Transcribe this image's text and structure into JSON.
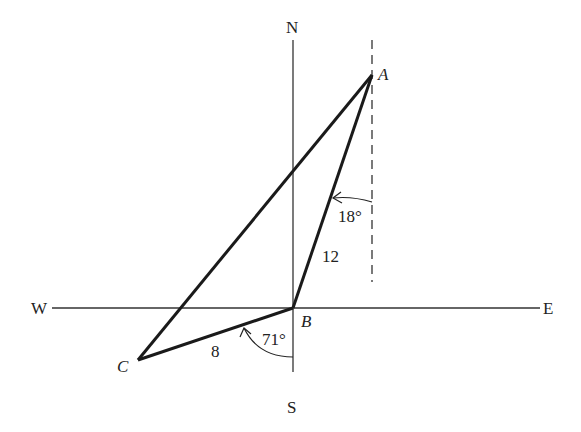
{
  "compass": {
    "north": "N",
    "south": "S",
    "west": "W",
    "east": "E"
  },
  "points": {
    "A": "A",
    "B": "B",
    "C": "C"
  },
  "sides": {
    "AB": "12",
    "BC": "8"
  },
  "angles": {
    "at_A": "18°",
    "at_B": "71°"
  },
  "colors": {
    "stroke": "#1a1a1a",
    "background": "#ffffff"
  }
}
